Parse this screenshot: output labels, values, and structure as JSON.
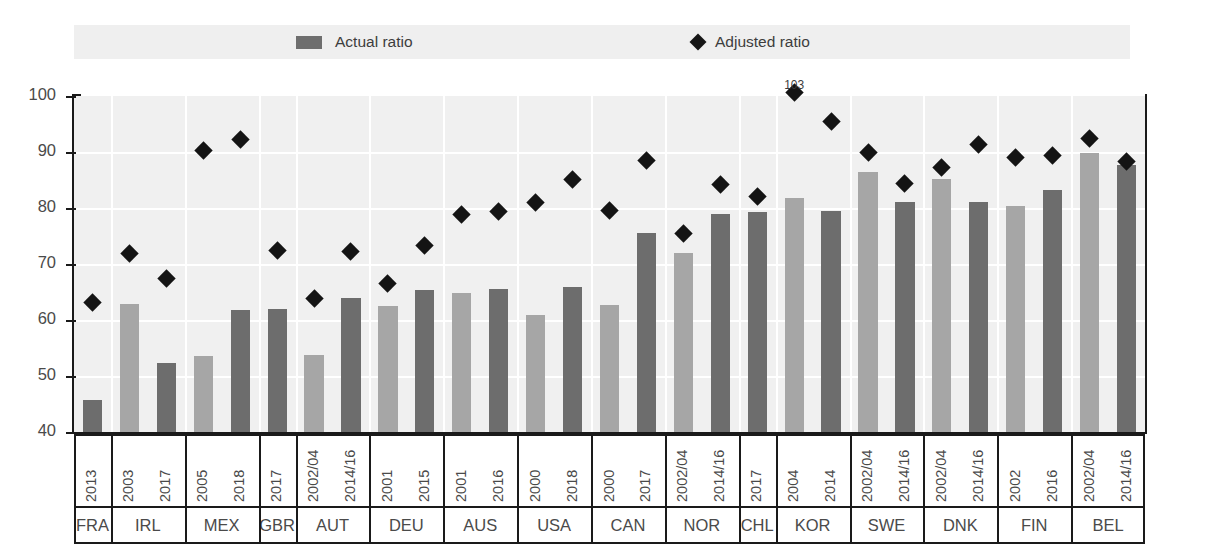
{
  "legend": {
    "items": [
      {
        "label": "Actual ratio",
        "marker": "bar-swatch-icon",
        "color": "#6e6e6e"
      },
      {
        "label": "Adjusted ratio",
        "marker": "diamond-icon",
        "color": "#161616"
      }
    ]
  },
  "colors": {
    "bar_light": "#a6a6a6",
    "bar_dark": "#6d6d6d",
    "marker": "#141414",
    "plot_background": "#f0f0f0",
    "legend_background": "#efefef",
    "axis": "#1a1a1a"
  },
  "chart_data": {
    "type": "bar",
    "title": "",
    "xlabel": "",
    "ylabel": "",
    "ylim": [
      40,
      100
    ],
    "yticks": [
      40,
      50,
      60,
      70,
      80,
      90,
      100
    ],
    "grid": true,
    "legend_position": "top",
    "categories": [
      "FRA 2013",
      "IRL 2003",
      "IRL 2017",
      "MEX 2005",
      "MEX 2018",
      "GBR 2017",
      "AUT 2002/04",
      "AUT 2014/16",
      "DEU 2001",
      "DEU 2015",
      "AUS 2001",
      "AUS 2016",
      "USA 2000",
      "USA 2018",
      "CAN 2000",
      "CAN 2017",
      "NOR 2002/04",
      "NOR 2014/16",
      "CHL 2017",
      "KOR 2004",
      "KOR 2014",
      "SWE 2002/04",
      "SWE 2014/16",
      "DNK 2002/04",
      "DNK 2014/16",
      "FIN 2002",
      "FIN 2016",
      "BEL 2002/04",
      "BEL 2014/16"
    ],
    "series": [
      {
        "name": "Actual ratio",
        "values": [
          45.8,
          62.8,
          52.4,
          53.5,
          61.7,
          61.9,
          53.7,
          63.9,
          62.5,
          65.4,
          64.9,
          65.6,
          60.9,
          65.9,
          62.7,
          75.6,
          71.9,
          78.9,
          79.2,
          81.7,
          79.4,
          86.5,
          81.0,
          85.1,
          81.1,
          80.3,
          83.2,
          89.8,
          87.7
        ]
      },
      {
        "name": "Adjusted ratio",
        "values": [
          63.1,
          71.8,
          67.5,
          90.2,
          92.3,
          72.4,
          63.9,
          72.2,
          66.6,
          73.3,
          78.9,
          79.3,
          81.0,
          85.1,
          79.5,
          88.5,
          75.5,
          84.2,
          82.0,
          103.0,
          95.5,
          89.9,
          84.3,
          87.2,
          91.3,
          89.0,
          89.3,
          92.5,
          88.3
        ]
      }
    ],
    "annotations": [
      {
        "category": "KOR 2004",
        "series": "Adjusted ratio",
        "text": "103",
        "value": 103
      }
    ]
  },
  "axis": {
    "y_tick_labels": [
      "100",
      "90",
      "80",
      "70",
      "60",
      "50",
      "40"
    ],
    "groups": [
      {
        "code": "FRA",
        "years": [
          "2013"
        ]
      },
      {
        "code": "IRL",
        "years": [
          "2003",
          "2017"
        ]
      },
      {
        "code": "MEX",
        "years": [
          "2005",
          "2018"
        ]
      },
      {
        "code": "GBR",
        "years": [
          "2017"
        ]
      },
      {
        "code": "AUT",
        "years": [
          "2002/04",
          "2014/16"
        ]
      },
      {
        "code": "DEU",
        "years": [
          "2001",
          "2015"
        ]
      },
      {
        "code": "AUS",
        "years": [
          "2001",
          "2016"
        ]
      },
      {
        "code": "USA",
        "years": [
          "2000",
          "2018"
        ]
      },
      {
        "code": "CAN",
        "years": [
          "2000",
          "2017"
        ]
      },
      {
        "code": "NOR",
        "years": [
          "2002/04",
          "2014/16"
        ]
      },
      {
        "code": "CHL",
        "years": [
          "2017"
        ]
      },
      {
        "code": "KOR",
        "years": [
          "2004",
          "2014"
        ]
      },
      {
        "code": "SWE",
        "years": [
          "2002/04",
          "2014/16"
        ]
      },
      {
        "code": "DNK",
        "years": [
          "2002/04",
          "2014/16"
        ]
      },
      {
        "code": "FIN",
        "years": [
          "2002",
          "2016"
        ]
      },
      {
        "code": "BEL",
        "years": [
          "2002/04",
          "2014/16"
        ]
      }
    ]
  }
}
